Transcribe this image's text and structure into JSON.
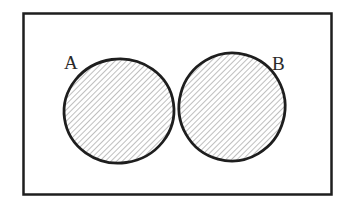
{
  "diagram": {
    "type": "venn",
    "shaded_region": "symmetric difference (A xor B)",
    "sets": [
      {
        "id": "A",
        "label": "A"
      },
      {
        "id": "B",
        "label": "B"
      }
    ],
    "colors": {
      "stroke": "#1e1e1e",
      "hatch": "#8a8a8a",
      "background": "#ffffff"
    }
  }
}
